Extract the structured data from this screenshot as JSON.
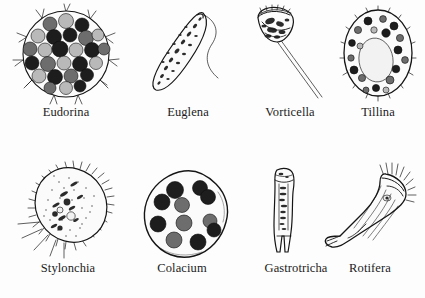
{
  "plate": {
    "title": "Protozoa and micro-invertebrates illustration plate",
    "background_color": "#fdfdfd",
    "ink_color": "#151515",
    "rows": 2,
    "columns": 4,
    "bottom_note": "",
    "specimens": [
      {
        "id": "eudorina",
        "label": "Eudorina",
        "row": 1,
        "column": 1,
        "group": "colonial green alga",
        "shape": "spherical colony",
        "features": "gelatinous sphere enclosing about 28 rounded cells, paired flagella radiating outward",
        "cell_count": 28
      },
      {
        "id": "euglena",
        "label": "Euglena",
        "row": 1,
        "column": 2,
        "group": "flagellate",
        "shape": "elongated spindle",
        "features": "tapered body with granular cytoplasm and one long trailing flagellum",
        "cell_count": 1
      },
      {
        "id": "vorticella",
        "label": "Vorticella",
        "row": 1,
        "column": 3,
        "group": "ciliate",
        "shape": "bell on stalk",
        "features": "inverted bell-shaped zooid with ciliated peristome on a long contractile stalk",
        "cell_count": 1
      },
      {
        "id": "tillina",
        "label": "Tillina",
        "row": 1,
        "column": 4,
        "group": "ciliate",
        "shape": "oval",
        "features": "ovoid ciliated body with a large pale food vacuole and numerous dark granules",
        "cell_count": 1
      },
      {
        "id": "stylonchia",
        "label": "Stylonchia",
        "row": 2,
        "column": 1,
        "group": "ciliate",
        "shape": "oval, obliquely set",
        "features": "stippled body fringed with cilia and stiff ventral cirri at the posterior end",
        "cell_count": 1
      },
      {
        "id": "colacium",
        "label": "Colacium",
        "row": 2,
        "column": 2,
        "group": "flagellate",
        "shape": "irregular rounded",
        "features": "lobed rounded cell containing about eleven dark chromatophore bodies",
        "cell_count": 11
      },
      {
        "id": "gastrotricha",
        "label": "Gastrotricha",
        "row": 2,
        "column": 3,
        "group": "micro-invertebrate",
        "shape": "narrow elongated",
        "features": "slender bottle-shaped body with rounded head and forked adhesive tail",
        "cell_count": 1
      },
      {
        "id": "rotifera",
        "label": "Rotifera",
        "row": 2,
        "column": 4,
        "group": "micro-invertebrate",
        "shape": "elongated, inclined",
        "features": "tubular body with ciliated corona at the anterior end and a forked foot",
        "cell_count": 1
      }
    ]
  }
}
